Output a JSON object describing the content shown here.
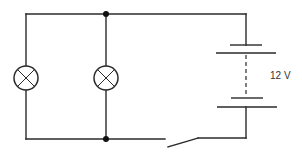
{
  "diagram": {
    "type": "circuit",
    "battery": {
      "label": "12 V",
      "voltage": 12,
      "unit": "V"
    },
    "components": [
      {
        "id": "lamp-1",
        "kind": "lamp",
        "position": "left"
      },
      {
        "id": "lamp-2",
        "kind": "lamp",
        "position": "middle"
      },
      {
        "id": "battery",
        "kind": "battery",
        "position": "right"
      },
      {
        "id": "switch",
        "kind": "switch",
        "state": "open",
        "position": "bottom"
      }
    ],
    "junctions": 2,
    "colors": {
      "line": "#2a2a2a",
      "background": "#ffffff"
    }
  }
}
